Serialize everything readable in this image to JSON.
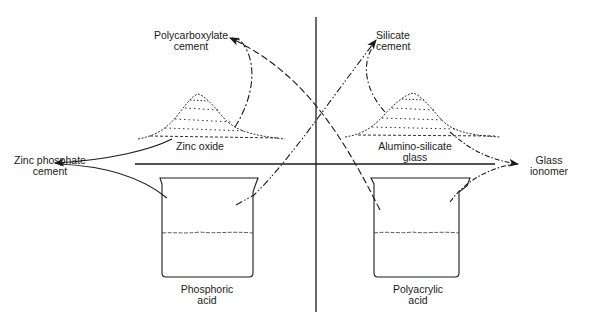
{
  "diagram": {
    "type": "dental cement formation schematic",
    "colors": {
      "ink": "#1a1a1a",
      "background": "#ffffff"
    },
    "powders": [
      {
        "id": "zinc-oxide",
        "label_lines": [
          "Zinc oxide"
        ]
      },
      {
        "id": "alumino-silicate-glass",
        "label_lines": [
          "Alumino-silicate",
          "glass"
        ]
      }
    ],
    "liquids": [
      {
        "id": "phosphoric-acid",
        "label_lines": [
          "Phosphoric",
          "acid"
        ]
      },
      {
        "id": "polyacrylic-acid",
        "label_lines": [
          "Polyacrylic",
          "acid"
        ]
      }
    ],
    "products": [
      {
        "id": "polycarboxylate-cement",
        "label_lines": [
          "Polycarboxylate",
          "cement"
        ],
        "from": [
          "Zinc oxide",
          "Polyacrylic acid"
        ]
      },
      {
        "id": "silicate-cement",
        "label_lines": [
          "Silicate",
          "cement"
        ],
        "from": [
          "Alumino-silicate glass",
          "Phosphoric acid"
        ]
      },
      {
        "id": "zinc-phosphate-cement",
        "label_lines": [
          "Zinc phosphate",
          "cement"
        ],
        "from": [
          "Zinc oxide",
          "Phosphoric acid"
        ]
      },
      {
        "id": "glass-ionomer",
        "label_lines": [
          "Glass",
          "ionomer"
        ],
        "from": [
          "Alumino-silicate glass",
          "Polyacrylic acid"
        ]
      }
    ]
  }
}
